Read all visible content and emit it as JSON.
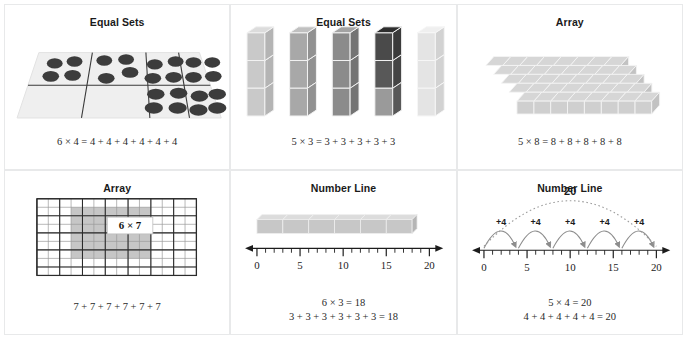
{
  "page": {
    "background": "#ffffff",
    "panel_border": "#e8e9ea"
  },
  "panels": [
    {
      "id": "equal-sets-counters",
      "title": "Equal Sets",
      "model": "counters-on-mat",
      "groups": 6,
      "per_group": 4,
      "equation": "6 × 4 = 4 + 4 + 4 + 4 + 4 + 4",
      "counter_color": "#3a3a3a",
      "mat_color": "#efefef"
    },
    {
      "id": "equal-sets-cubes",
      "title": "Equal Sets",
      "model": "cube-stacks",
      "stacks": 5,
      "cubes_per_stack": 3,
      "equation": "5 × 3 = 3 + 3 + 3 + 3 + 3",
      "stack_colors": [
        "#c9c9c9",
        "#a8a8a8",
        "#8b8b8b",
        "#555555",
        "#e0e0e0"
      ]
    },
    {
      "id": "array-cubes",
      "title": "Array",
      "model": "isometric-cube-slab",
      "rows": 5,
      "cols": 8,
      "equation": "5 × 8 = 8 + 8 + 8 + 8 + 8",
      "cube_color": "#d6d6d6"
    },
    {
      "id": "array-grid",
      "title": "Array",
      "model": "shaded-grid",
      "grid_cols": 14,
      "grid_rows": 9,
      "shaded_cols": 7,
      "shaded_rows": 6,
      "shade_offset_col": 3,
      "shade_offset_row": 1,
      "callout": "6 × 7",
      "equation": "7 + 7 + 7 + 7 + 7 + 7",
      "shade_color": "#c6c6c6",
      "line_color": "#2b2b2b"
    },
    {
      "id": "number-line-bar",
      "title": "Number Line",
      "model": "number-line-bar",
      "axis_min": 0,
      "axis_max": 20,
      "ticks_major": [
        0,
        5,
        10,
        15,
        20
      ],
      "bar_segments": 6,
      "segment_length": 3,
      "bar_end": 18,
      "equation_top": "6 × 3 = 18",
      "equation_bottom": "3 + 3 + 3 + 3 + 3 + 3 = 18",
      "bar_color": "#c7c7c7"
    },
    {
      "id": "number-line-jumps",
      "title": "Number Line",
      "model": "number-line-jumps",
      "axis_min": 0,
      "axis_max": 20,
      "ticks_major": [
        0,
        5,
        10,
        15,
        20
      ],
      "jump_count": 5,
      "jump_size": 4,
      "jump_label": "+4",
      "total_label": "20",
      "equation_top": "5 × 4 = 20",
      "equation_bottom": "4 + 4 + 4 + 4 + 4 = 20",
      "arc_color": "#8d8d8d"
    }
  ]
}
